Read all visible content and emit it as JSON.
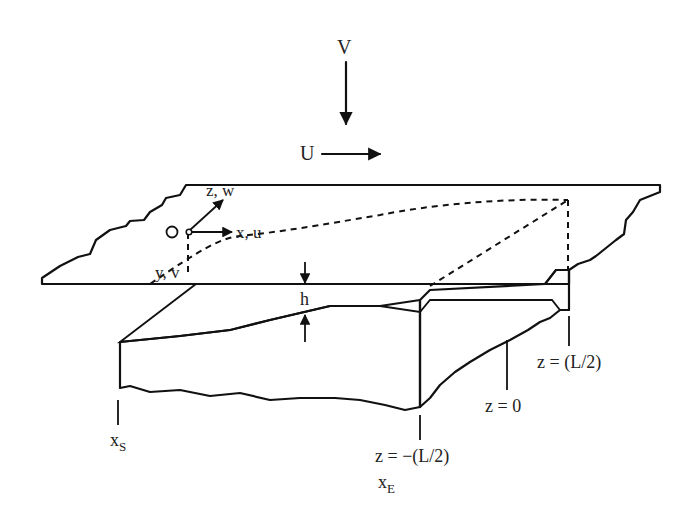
{
  "diagram": {
    "type": "thin-film flow geometry (moving plate over substrate with hatched fluid gap)",
    "colors": {
      "stroke": "#111111",
      "background": "#ffffff",
      "text": "#222222"
    },
    "labels": {
      "velocity_v": "V",
      "velocity_u": "U",
      "origin": "O",
      "axis_z": "z, w",
      "axis_x": "x, u",
      "axis_y": "y, v",
      "gap": "h",
      "z_pos": "z = (L/2)",
      "z_zero": "z = 0",
      "z_neg": "z = −(L/2)",
      "x_start_main": "x",
      "x_start_sub": "S",
      "x_end_main": "x",
      "x_end_sub": "E"
    }
  }
}
